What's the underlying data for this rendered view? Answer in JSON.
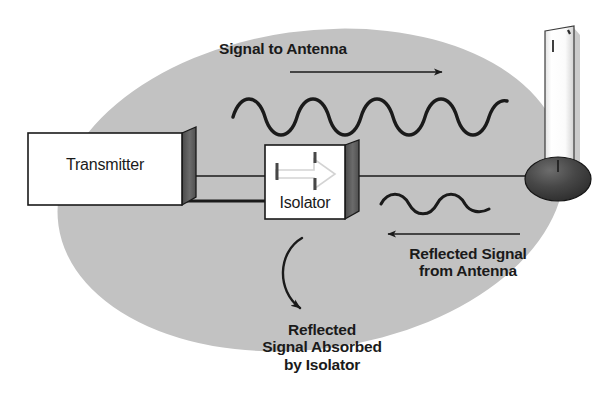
{
  "diagram": {
    "background_color": "#ffffff",
    "field_color": "#c2c2c2",
    "stroke_color": "#1a1a1a",
    "box_face_color": "#ffffff",
    "box_side_color": "#5a5a5a"
  },
  "blocks": {
    "transmitter": {
      "label": "Transmitter"
    },
    "isolator": {
      "label": "Isolator"
    }
  },
  "annotations": {
    "signal_to_antenna": "Signal to Antenna",
    "reflected_from_antenna_line1": "Reflected Signal",
    "reflected_from_antenna_line2": "from Antenna",
    "reflected_absorbed_line1": "Reflected",
    "reflected_absorbed_line2": "Signal Absorbed",
    "reflected_absorbed_line3": "by Isolator"
  },
  "graphics": {
    "forward_wave_cycles": "4.5",
    "reflected_wave_cycles": "1.5",
    "forward_arrow_direction": "right",
    "reflected_arrow_direction": "left",
    "absorb_arrow_direction": "curved-down",
    "antenna_type": "whip-antenna"
  }
}
